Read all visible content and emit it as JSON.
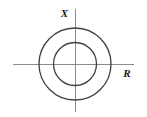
{
  "figure": {
    "name": "impedance-plane-concentric-circles",
    "background_color": "#ffffff",
    "width": 147,
    "height": 117,
    "axes": {
      "vertical": {
        "label": "X",
        "name": "reactance-axis",
        "color": "#8c8c8c",
        "x": 75,
        "y_top": 9,
        "y_bottom": 112,
        "stroke_width": 1
      },
      "horizontal": {
        "label": "R",
        "name": "resistance-axis",
        "color": "#8c8c8c",
        "y": 64,
        "x_left": 13,
        "x_right": 134,
        "stroke_width": 1
      }
    },
    "label_positions": {
      "x_label": {
        "x": 68,
        "y": 17
      },
      "r_label": {
        "x": 127,
        "y": 77
      }
    },
    "circles": [
      {
        "name": "outer-circle",
        "cx": 75,
        "cy": 64,
        "r": 36,
        "stroke": "#404040",
        "stroke_width": 1.3,
        "fill": "none"
      },
      {
        "name": "inner-circle",
        "cx": 75,
        "cy": 64,
        "r": 21.5,
        "stroke": "#404040",
        "stroke_width": 1.3,
        "fill": "none"
      }
    ]
  }
}
